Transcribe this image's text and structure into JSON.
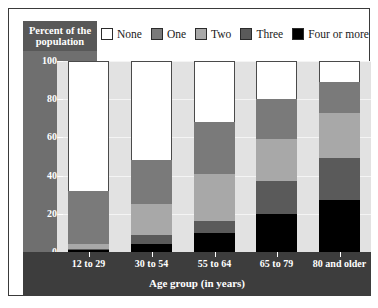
{
  "chart_data": {
    "type": "bar",
    "subtype": "stacked-bar-100",
    "title": "",
    "xlabel": "Age group (in years)",
    "ylabel": "Percent of the population",
    "ylim": [
      0,
      100
    ],
    "yticks": [
      0,
      20,
      40,
      60,
      80,
      100
    ],
    "grid": true,
    "legend_position": "top",
    "categories": [
      "12 to 29",
      "30 to 54",
      "55 to 64",
      "65 to 79",
      "80 and older"
    ],
    "series": [
      {
        "name": "None",
        "color": "#ffffff",
        "values": [
          68,
          52,
          32,
          20,
          11
        ]
      },
      {
        "name": "One",
        "color": "#7a7a7a",
        "values": [
          28,
          23,
          27,
          21,
          16
        ]
      },
      {
        "name": "Two",
        "color": "#a8a8a8",
        "values": [
          2.5,
          16,
          25,
          22,
          24
        ]
      },
      {
        "name": "Three",
        "color": "#5a5a5a",
        "values": [
          0.5,
          5,
          6,
          17,
          22
        ]
      },
      {
        "name": "Four or more",
        "color": "#000000",
        "values": [
          1,
          4,
          10,
          20,
          27
        ]
      }
    ]
  },
  "legend": {
    "items": [
      {
        "label": "None",
        "color": "#ffffff"
      },
      {
        "label": "One",
        "color": "#7a7a7a"
      },
      {
        "label": "Two",
        "color": "#a8a8a8"
      },
      {
        "label": "Three",
        "color": "#5a5a5a"
      },
      {
        "label": "Four or more",
        "color": "#000000"
      }
    ]
  },
  "axes": {
    "y_title": "Percent of the population",
    "x_title": "Age group (in years)",
    "y_tick_labels": [
      "100",
      "80",
      "60",
      "40",
      "20",
      "0"
    ],
    "x_tick_labels": [
      "12 to 29",
      "30 to 54",
      "55 to 64",
      "65 to 79",
      "80 and older"
    ]
  },
  "colors": {
    "plot_background": "#e2e2e2",
    "y_band": "#6f6f6f",
    "x_band": "#3d3d3d",
    "y_title_box": "#585858",
    "frame_border": "#3a3a3a",
    "gridline": "#f4f4f4"
  }
}
